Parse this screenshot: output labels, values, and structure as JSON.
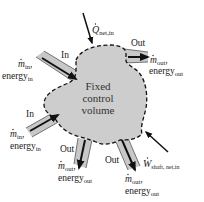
{
  "diagram": {
    "center_label": {
      "line1": "Fixed",
      "line2": "control",
      "line3": "volume"
    },
    "heat_input": {
      "symbol": "Q",
      "subscript": "net,in"
    },
    "work_input": {
      "symbol": "W",
      "subscript": "shaft, net,in"
    },
    "inlets": [
      {
        "tag": "In",
        "mass_symbol": "m",
        "mass_subscript": "in",
        "energy_word": "energy",
        "energy_subscript": "in"
      },
      {
        "tag": "In",
        "mass_symbol": "m",
        "mass_subscript": "in",
        "energy_word": "energy",
        "energy_subscript": "in"
      }
    ],
    "outlets": [
      {
        "tag": "Out",
        "mass_symbol": "m",
        "mass_subscript": "out",
        "energy_word": "energy",
        "energy_subscript": "out"
      },
      {
        "tag": "Out",
        "mass_symbol": "m",
        "mass_subscript": "out",
        "energy_word": "energy",
        "energy_subscript": "out"
      },
      {
        "tag": "Out",
        "mass_symbol": "m",
        "mass_subscript": "out",
        "energy_word": "energy",
        "energy_subscript": "out"
      }
    ],
    "colors": {
      "volume_fill": "#cdcdcd",
      "pipe_fill": "#c8c8c8",
      "outline": "#111111",
      "text": "#222222"
    }
  }
}
